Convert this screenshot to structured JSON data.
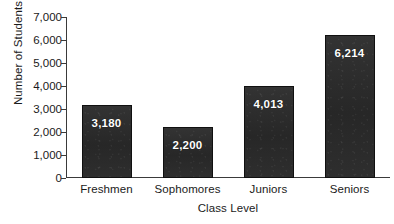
{
  "chart_data": {
    "type": "bar",
    "title": "",
    "xlabel": "Class Level",
    "ylabel": "Number of Students",
    "categories": [
      "Freshmen",
      "Sophomores",
      "Juniors",
      "Seniors"
    ],
    "values": [
      3180,
      2200,
      4013,
      6214
    ],
    "value_labels": [
      "3,180",
      "2,200",
      "4,013",
      "6,214"
    ],
    "ylim": [
      0,
      7000
    ],
    "ytick_values": [
      0,
      1000,
      2000,
      3000,
      4000,
      5000,
      6000,
      7000
    ],
    "ytick_labels": [
      "0",
      "1,000",
      "2,000",
      "3,000",
      "4,000",
      "5,000",
      "6,000",
      "7,000"
    ],
    "grid": false,
    "legend": false,
    "bar_color": "#2c2c2c",
    "bar_edge_color": "#101010",
    "value_label_color": "#ffffff",
    "axis_color": "#3a3a3a",
    "text_color": "#1a1a1a",
    "background_color": "#ffffff"
  }
}
